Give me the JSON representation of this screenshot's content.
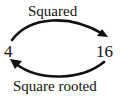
{
  "diagram": {
    "nodes": [
      {
        "id": "left",
        "label": "4"
      },
      {
        "id": "right",
        "label": "16"
      }
    ],
    "edges": [
      {
        "from": "left",
        "to": "right",
        "label": "Squared",
        "position": "top"
      },
      {
        "from": "right",
        "to": "left",
        "label": "Square rooted",
        "position": "bottom"
      }
    ],
    "colors": {
      "stroke": "#111111",
      "background": "#ffffff"
    }
  }
}
